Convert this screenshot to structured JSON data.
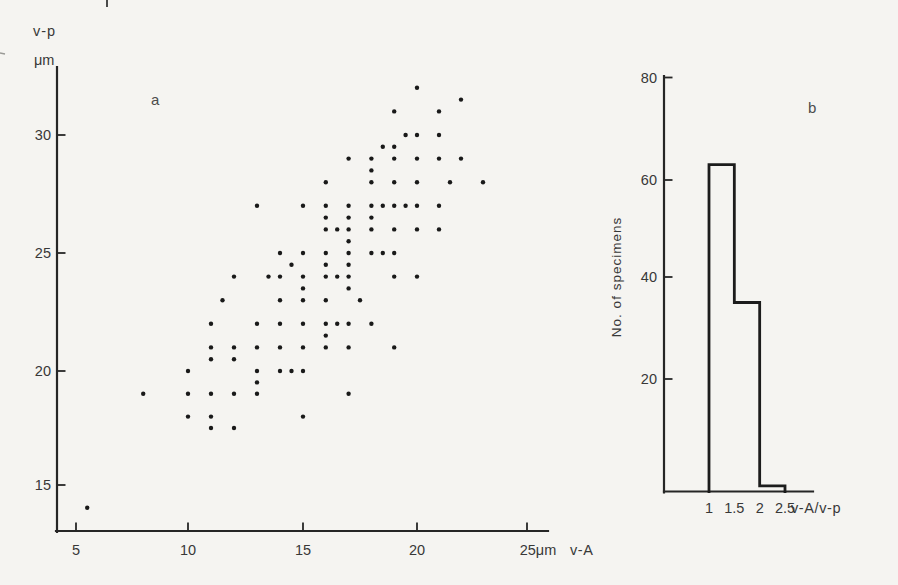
{
  "chart_data": [
    {
      "type": "scatter",
      "panel_label": "a",
      "x_axis": {
        "name": "v-A",
        "ticks": [
          5,
          10,
          15,
          20,
          25
        ],
        "tick_labels": [
          "5",
          "10",
          "15",
          "20",
          "25μm"
        ],
        "lim": [
          4.1,
          25.9
        ]
      },
      "y_axis": {
        "title": "v-p",
        "unit": "μm",
        "ticks": [
          15,
          20,
          25,
          30
        ],
        "tick_labels": [
          "15",
          "20",
          "25",
          "30"
        ],
        "lim": [
          13.0,
          32.8
        ]
      },
      "points": [
        [
          20,
          32
        ],
        [
          22,
          31.5
        ],
        [
          19,
          31
        ],
        [
          21,
          31
        ],
        [
          19.5,
          30
        ],
        [
          20,
          30
        ],
        [
          21,
          30
        ],
        [
          18.5,
          29.5
        ],
        [
          19,
          29.5
        ],
        [
          17,
          29
        ],
        [
          18,
          29
        ],
        [
          19,
          29
        ],
        [
          20,
          29
        ],
        [
          21,
          29
        ],
        [
          22,
          29
        ],
        [
          18,
          28.5
        ],
        [
          16,
          28
        ],
        [
          18,
          28
        ],
        [
          19,
          28
        ],
        [
          20,
          28
        ],
        [
          21.5,
          28
        ],
        [
          23,
          28
        ],
        [
          13,
          27
        ],
        [
          15,
          27
        ],
        [
          16,
          27
        ],
        [
          17,
          27
        ],
        [
          18,
          27
        ],
        [
          18.5,
          27
        ],
        [
          19,
          27
        ],
        [
          19.5,
          27
        ],
        [
          20,
          27
        ],
        [
          21,
          27
        ],
        [
          16,
          26.5
        ],
        [
          17,
          26.5
        ],
        [
          18,
          26.5
        ],
        [
          16,
          26
        ],
        [
          16.5,
          26
        ],
        [
          17,
          26
        ],
        [
          18,
          26
        ],
        [
          19,
          26
        ],
        [
          20,
          26
        ],
        [
          21,
          26
        ],
        [
          17,
          25.5
        ],
        [
          14,
          25
        ],
        [
          15,
          25
        ],
        [
          16,
          25
        ],
        [
          17,
          25
        ],
        [
          18,
          25
        ],
        [
          18.5,
          25
        ],
        [
          19,
          25
        ],
        [
          14.5,
          24.5
        ],
        [
          16,
          24.5
        ],
        [
          17,
          24.5
        ],
        [
          12,
          24
        ],
        [
          13.5,
          24
        ],
        [
          14,
          24
        ],
        [
          15,
          24
        ],
        [
          16,
          24
        ],
        [
          16.5,
          24
        ],
        [
          17,
          24
        ],
        [
          19,
          24
        ],
        [
          20,
          24
        ],
        [
          15,
          23.5
        ],
        [
          17,
          23.5
        ],
        [
          11.5,
          23
        ],
        [
          14,
          23
        ],
        [
          15,
          23
        ],
        [
          16,
          23
        ],
        [
          17.5,
          23
        ],
        [
          11,
          22
        ],
        [
          13,
          22
        ],
        [
          14,
          22
        ],
        [
          15,
          22
        ],
        [
          16,
          22
        ],
        [
          16.5,
          22
        ],
        [
          17,
          22
        ],
        [
          18,
          22
        ],
        [
          16,
          21.5
        ],
        [
          11,
          21
        ],
        [
          12,
          21
        ],
        [
          13,
          21
        ],
        [
          14,
          21
        ],
        [
          15,
          21
        ],
        [
          16,
          21
        ],
        [
          17,
          21
        ],
        [
          19,
          21
        ],
        [
          11,
          20.5
        ],
        [
          12,
          20.5
        ],
        [
          10,
          20
        ],
        [
          13,
          20
        ],
        [
          14,
          20
        ],
        [
          14.5,
          20
        ],
        [
          15,
          20
        ],
        [
          13,
          19.5
        ],
        [
          8,
          19
        ],
        [
          10,
          19
        ],
        [
          11,
          19
        ],
        [
          12,
          19
        ],
        [
          13,
          19
        ],
        [
          17,
          19
        ],
        [
          10,
          18
        ],
        [
          11,
          18
        ],
        [
          15,
          18
        ],
        [
          11,
          17.5
        ],
        [
          12,
          17.5
        ],
        [
          5.5,
          14
        ]
      ]
    },
    {
      "type": "histogram",
      "panel_label": "b",
      "x_axis": {
        "name": "v-A/v-p",
        "ticks": [
          1,
          1.5,
          2,
          2.5
        ],
        "tick_labels": [
          "1",
          "1.5",
          "2",
          "2.5"
        ],
        "lim": [
          0.1,
          3.0
        ]
      },
      "y_axis": {
        "title": "No. of specimens",
        "ticks": [
          20,
          40,
          60,
          80
        ],
        "tick_labels": [
          "20",
          "40",
          "60",
          "80"
        ],
        "lim": [
          0,
          80
        ]
      },
      "bin_edges": [
        1,
        1.5,
        2,
        2.5
      ],
      "counts": [
        63,
        35,
        1
      ]
    }
  ],
  "colors": {
    "background": "#f5f4f1",
    "ink": "#262626",
    "dot": "#191919",
    "text": "#383838"
  }
}
